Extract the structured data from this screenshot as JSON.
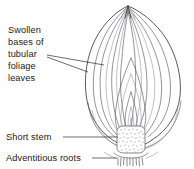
{
  "figure": {
    "background_color": "#ffffff",
    "line_color": "#2e2e33",
    "text_color": "#1a1a1a"
  },
  "labels": {
    "swollen_bases": {
      "name": "swollen-bases-of-tubular-foliage-leaves",
      "lines": [
        "Swollen",
        "bases of",
        "tubular",
        "foliage",
        "leaves"
      ]
    },
    "short_stem": {
      "name": "short-stem",
      "text": "Short stem"
    },
    "adventitious_roots": {
      "name": "adventitious-roots",
      "text": "Adventitious roots"
    }
  },
  "parts": {
    "bulb": "onion-bulb",
    "leaf_scales": "concentric-leaf-scales",
    "apex_neck": "bulb-neck-apex",
    "basal_plate": "short-stem-basal-plate",
    "roots": "adventitious-root-hairs"
  }
}
